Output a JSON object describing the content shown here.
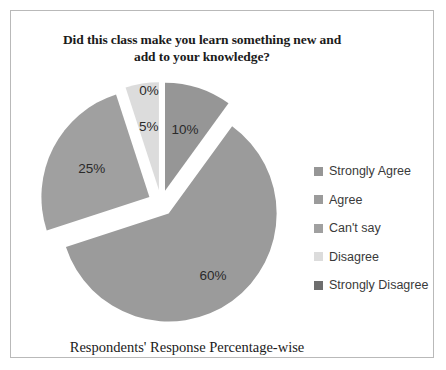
{
  "frame": {
    "border_color": "#b9b9b9"
  },
  "title": {
    "line1": "Did this class make you learn something new and",
    "line2": "add to your knowledge?"
  },
  "caption": {
    "text": "Respondents' Response Percentage-wise"
  },
  "legend": {
    "position": "right",
    "items": [
      {
        "label": "Strongly Agree",
        "color": "#969696"
      },
      {
        "label": "Agree",
        "color": "#9b9b9b"
      },
      {
        "label": "Can't say",
        "color": "#a0a0a0"
      },
      {
        "label": "Disagree",
        "color": "#dcdcdc"
      },
      {
        "label": "Strongly Disagree",
        "color": "#6e6e6e"
      }
    ]
  },
  "chart_data": {
    "type": "pie",
    "title": "Did this class make you learn something new and add to your knowledge?",
    "xlabel": "",
    "ylabel": "",
    "exploded": true,
    "start_angle_deg": 0,
    "direction": "clockwise",
    "categories": [
      "Strongly Agree",
      "Agree",
      "Can't say",
      "Disagree",
      "Strongly Disagree"
    ],
    "values": [
      10,
      60,
      25,
      5,
      0
    ],
    "unit": "percent",
    "data_labels": [
      "10%",
      "60%",
      "25%",
      "5%",
      "0%"
    ],
    "colors": [
      "#969696",
      "#9b9b9b",
      "#a0a0a0",
      "#dcdcdc",
      "#6e6e6e"
    ],
    "legend_position": "right",
    "grid": false
  }
}
